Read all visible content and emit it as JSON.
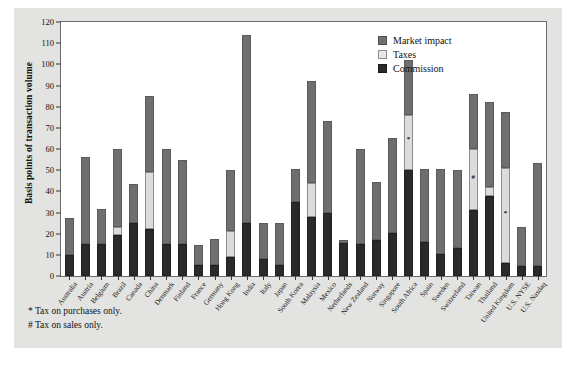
{
  "chart_data": {
    "type": "bar",
    "stacked": true,
    "title": "",
    "xlabel": "",
    "ylabel": "Basis points of transaction volume",
    "ylim": [
      0,
      120
    ],
    "yticks": [
      0,
      10,
      20,
      30,
      40,
      50,
      60,
      70,
      80,
      90,
      100,
      110,
      120
    ],
    "grid": false,
    "legend_position": "top-right",
    "legend": [
      "Market impact",
      "Taxes",
      "Commission"
    ],
    "series_colors": {
      "market_impact": "#6f6f6f",
      "taxes": "#dcdcdc",
      "commission": "#2a2a2a"
    },
    "categories": [
      "Australia",
      "Austria",
      "Belgium",
      "Brazil",
      "Canada",
      "China",
      "Denmark",
      "Finland",
      "France",
      "Germany",
      "Hong Kong",
      "India",
      "Italy",
      "Japan",
      "South Korea",
      "Malaysia",
      "Mexico",
      "Netherlands",
      "New Zealand",
      "Norway",
      "Singapore",
      "South Africa",
      "Spain",
      "Sweden",
      "Switzerland",
      "Taiwan",
      "Thailand",
      "United Kingdom",
      "U.S. NYSE",
      "U.S. Nasdaq"
    ],
    "series": [
      {
        "name": "Commission",
        "values": [
          10.0,
          15.0,
          15.0,
          19.5,
          25.0,
          22.0,
          15.0,
          15.0,
          5.0,
          5.0,
          9.0,
          25.0,
          8.0,
          5.0,
          35.0,
          28.0,
          30.0,
          15.5,
          15.0,
          17.0,
          20.5,
          50.0,
          16.0,
          10.5,
          13.0,
          31.0,
          38.0,
          6.0,
          4.5,
          4.5
        ]
      },
      {
        "name": "Taxes",
        "values": [
          0.0,
          0.0,
          0.0,
          3.5,
          0.0,
          27.0,
          0.0,
          0.0,
          0.0,
          0.0,
          12.5,
          0.0,
          0.0,
          0.0,
          0.0,
          16.0,
          0.0,
          0.0,
          0.0,
          0.0,
          0.0,
          26.0,
          0.0,
          0.0,
          0.0,
          29.0,
          4.0,
          45.0,
          0.0,
          0.0
        ]
      },
      {
        "name": "Market impact",
        "values": [
          17.5,
          41.0,
          16.5,
          37.0,
          18.5,
          36.0,
          45.0,
          40.0,
          9.5,
          12.5,
          28.5,
          89.0,
          17.0,
          20.0,
          15.5,
          48.0,
          43.0,
          1.5,
          45.0,
          27.5,
          44.5,
          26.0,
          34.5,
          40.0,
          37.0,
          26.0,
          40.0,
          26.5,
          18.5,
          49.0
        ]
      }
    ],
    "totals": [
      27.5,
      56.0,
      31.5,
      60.0,
      43.5,
      85.0,
      60.0,
      55.0,
      14.5,
      17.5,
      50.0,
      114.0,
      25.0,
      25.0,
      50.5,
      92.0,
      73.0,
      17.0,
      60.0,
      44.5,
      65.0,
      102.0,
      50.5,
      50.5,
      50.0,
      86.0,
      82.0,
      77.5,
      23.0,
      53.5
    ],
    "annotations": [
      {
        "category": "South Africa",
        "marker": "*",
        "value_position": 63
      },
      {
        "category": "Taiwan",
        "marker": "#",
        "value_position": 45
      },
      {
        "category": "United Kingdom",
        "marker": "*",
        "value_position": 28
      }
    ]
  },
  "legend": {
    "items": [
      {
        "label": "Market impact",
        "key": "mi"
      },
      {
        "label": "Taxes",
        "key": "tx"
      },
      {
        "label": "Commission",
        "key": "cm"
      }
    ]
  },
  "footnotes": [
    "* Tax on purchases only.",
    "# Tax on sales only."
  ]
}
